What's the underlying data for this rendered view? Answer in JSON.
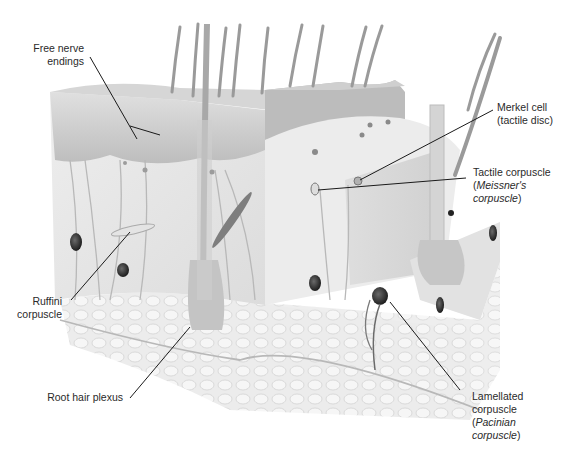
{
  "figure": {
    "background": "#ffffff",
    "colors": {
      "epidermis": "#c9c9c9",
      "dermis": "#e6e6e6",
      "hypodermis": "#ededed",
      "hair": "#9a9a9a",
      "nerve": "#b5b5b5",
      "corpuscle_dark": "#2e2e2e",
      "leader_line": "#1a1a1a",
      "label_text": "#2a2a2a"
    }
  },
  "labels": {
    "free_nerve_endings": {
      "line1": "Free nerve",
      "line2": "endings"
    },
    "merkel_cell": {
      "line1": "Merkel cell",
      "line2": "(tactile disc)"
    },
    "tactile_corpuscle": {
      "line1": "Tactile corpuscle",
      "line2_open": "(",
      "line2_italic": "Meissner's",
      "line3_italic": "corpuscle",
      "line3_close": ")"
    },
    "ruffini": {
      "line1": "Ruffini",
      "line2": "corpuscle"
    },
    "root_hair_plexus": {
      "line1": "Root hair plexus"
    },
    "lamellated": {
      "line1": "Lamellated",
      "line2": "corpuscle",
      "line3_open": "(",
      "line3_italic": "Pacinian",
      "line4_italic": "corpuscle",
      "line4_close": ")"
    }
  }
}
